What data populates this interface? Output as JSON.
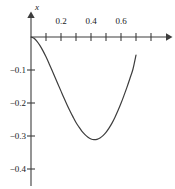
{
  "chart_data": {
    "type": "line",
    "title": "",
    "subtitle": "",
    "xlabel": "",
    "ylabel": "x",
    "grid": false,
    "legend": false,
    "legend_position": "none",
    "xlim": [
      0.0,
      0.73
    ],
    "ylim": [
      -0.44,
      0.02
    ],
    "x_major_ticks": [
      0.2,
      0.4,
      0.6
    ],
    "x_major_tick_labels": [
      "0.2",
      "0.4",
      "0.6"
    ],
    "x_minor_ticks": [
      0.1,
      0.3,
      0.5,
      0.7
    ],
    "y_major_ticks": [
      -0.1,
      -0.2,
      -0.3,
      -0.4
    ],
    "y_major_tick_labels": [
      "−0.1",
      "−0.2",
      "−0.3",
      "−0.4"
    ],
    "axis_color": "#3d3d3d",
    "curve_color": "#3d3d3d",
    "x_axis_arrow": true,
    "y_axis_arrow": true,
    "series": [
      {
        "name": "x(t)",
        "x": [
          0.0,
          0.02,
          0.04,
          0.06,
          0.08,
          0.1,
          0.12,
          0.14,
          0.16,
          0.18,
          0.2,
          0.22,
          0.24,
          0.26,
          0.28,
          0.3,
          0.32,
          0.34,
          0.36,
          0.38,
          0.4,
          0.42,
          0.44,
          0.46,
          0.48,
          0.5,
          0.52,
          0.54,
          0.56,
          0.58,
          0.6,
          0.62,
          0.64,
          0.66,
          0.68,
          0.7
        ],
        "y": [
          0.0,
          -0.004,
          -0.013,
          -0.026,
          -0.042,
          -0.06,
          -0.08,
          -0.101,
          -0.122,
          -0.143,
          -0.164,
          -0.185,
          -0.205,
          -0.224,
          -0.242,
          -0.259,
          -0.273,
          -0.286,
          -0.296,
          -0.304,
          -0.309,
          -0.311,
          -0.31,
          -0.306,
          -0.299,
          -0.289,
          -0.276,
          -0.261,
          -0.243,
          -0.223,
          -0.201,
          -0.177,
          -0.152,
          -0.125,
          -0.097,
          -0.055
        ]
      }
    ],
    "annotations": {
      "minimum_value": -0.311,
      "minimum_at_x": 0.42,
      "start_point": [
        0.0,
        0.0
      ],
      "end_point": [
        0.7,
        -0.055
      ]
    }
  }
}
